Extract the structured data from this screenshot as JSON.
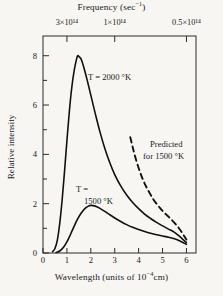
{
  "chart_data": {
    "type": "line",
    "title": "",
    "xlabel": "Wavelength (units of 10−4cm)",
    "ylabel": "Relative intensity",
    "top_axis_label": "Frequency  (sec−1)",
    "xlim": [
      0,
      6.4
    ],
    "ylim": [
      0,
      8.8
    ],
    "x_ticks": [
      0,
      1,
      2,
      3,
      4,
      5,
      6
    ],
    "x_tick_labels": [
      "0",
      "1",
      "2",
      "3",
      "4",
      "5",
      "6"
    ],
    "y_ticks": [
      0,
      2,
      4,
      6,
      8
    ],
    "y_tick_labels": [
      "0",
      "2",
      "4",
      "6",
      "8"
    ],
    "y_minor_ticks": [
      1,
      3,
      5,
      7
    ],
    "top_ticks_wavelength": [
      1,
      3,
      6
    ],
    "top_tick_labels": [
      "3×10¹⁴",
      "1×10¹⁴",
      "0.5×10¹⁴"
    ],
    "grid": false,
    "legend_position": "inline-annotations",
    "series": [
      {
        "name": "T = 2000 °K",
        "style": "solid",
        "peak_x": 1.45,
        "peak_y": 8.0,
        "points": [
          [
            0.4,
            0.05
          ],
          [
            0.5,
            0.18
          ],
          [
            0.6,
            0.52
          ],
          [
            0.7,
            1.2
          ],
          [
            0.8,
            2.15
          ],
          [
            0.9,
            3.3
          ],
          [
            1.0,
            4.55
          ],
          [
            1.1,
            5.72
          ],
          [
            1.2,
            6.68
          ],
          [
            1.3,
            7.38
          ],
          [
            1.4,
            7.85
          ],
          [
            1.45,
            8.0
          ],
          [
            1.5,
            7.97
          ],
          [
            1.6,
            7.85
          ],
          [
            1.7,
            7.55
          ],
          [
            1.85,
            7.0
          ],
          [
            2.0,
            6.4
          ],
          [
            2.2,
            5.6
          ],
          [
            2.4,
            4.85
          ],
          [
            2.6,
            4.2
          ],
          [
            2.8,
            3.65
          ],
          [
            3.0,
            3.18
          ],
          [
            3.25,
            2.72
          ],
          [
            3.5,
            2.35
          ],
          [
            3.75,
            2.05
          ],
          [
            4.0,
            1.8
          ],
          [
            4.25,
            1.58
          ],
          [
            4.5,
            1.4
          ],
          [
            4.75,
            1.24
          ],
          [
            5.0,
            1.1
          ],
          [
            5.25,
            0.97
          ],
          [
            5.5,
            0.84
          ],
          [
            5.75,
            0.64
          ],
          [
            6.0,
            0.42
          ]
        ]
      },
      {
        "name": "T = 1500 °K",
        "style": "solid",
        "peak_x": 2.0,
        "peak_y": 1.93,
        "points": [
          [
            0.55,
            0.02
          ],
          [
            0.7,
            0.08
          ],
          [
            0.85,
            0.22
          ],
          [
            1.0,
            0.45
          ],
          [
            1.15,
            0.75
          ],
          [
            1.3,
            1.08
          ],
          [
            1.45,
            1.38
          ],
          [
            1.6,
            1.62
          ],
          [
            1.75,
            1.8
          ],
          [
            1.9,
            1.9
          ],
          [
            2.0,
            1.93
          ],
          [
            2.1,
            1.92
          ],
          [
            2.25,
            1.88
          ],
          [
            2.4,
            1.8
          ],
          [
            2.6,
            1.68
          ],
          [
            2.8,
            1.55
          ],
          [
            3.0,
            1.42
          ],
          [
            3.25,
            1.28
          ],
          [
            3.5,
            1.15
          ],
          [
            3.75,
            1.04
          ],
          [
            4.0,
            0.95
          ],
          [
            4.25,
            0.87
          ],
          [
            4.5,
            0.8
          ],
          [
            4.75,
            0.74
          ],
          [
            5.0,
            0.69
          ],
          [
            5.25,
            0.64
          ],
          [
            5.5,
            0.58
          ],
          [
            5.75,
            0.48
          ],
          [
            6.0,
            0.35
          ]
        ]
      },
      {
        "name": "Predicted for 1500 °K",
        "style": "dashed",
        "points": [
          [
            3.65,
            4.7
          ],
          [
            3.75,
            4.3
          ],
          [
            3.85,
            3.92
          ],
          [
            4.0,
            3.45
          ],
          [
            4.15,
            3.05
          ],
          [
            4.3,
            2.72
          ],
          [
            4.45,
            2.45
          ],
          [
            4.6,
            2.2
          ],
          [
            4.75,
            2.0
          ],
          [
            4.9,
            1.82
          ],
          [
            5.05,
            1.66
          ],
          [
            5.2,
            1.52
          ],
          [
            5.35,
            1.38
          ],
          [
            5.5,
            1.22
          ],
          [
            5.65,
            1.05
          ],
          [
            5.8,
            0.85
          ],
          [
            5.95,
            0.62
          ],
          [
            6.0,
            0.55
          ]
        ]
      }
    ],
    "annotations": [
      {
        "id": "lab-2000",
        "text": "T = 2000  °K"
      },
      {
        "id": "lab-1500-a",
        "text": "T ="
      },
      {
        "id": "lab-1500-b",
        "text": "1500  °K"
      },
      {
        "id": "lab-pred-a",
        "text": "Predicted"
      },
      {
        "id": "lab-pred-b",
        "text": "for  1500  °K"
      }
    ]
  },
  "axes": {
    "top_title_main": "Frequency  (sec",
    "top_title_sup": "−1",
    "top_title_tail": ")",
    "bottom_title_main": "Wavelength  (units of  10",
    "bottom_title_sup": "−4",
    "bottom_title_tail": "cm)",
    "y_title": "Relative intensity"
  },
  "colors": {
    "background": "#f7f6f3",
    "ink": "#1a1a1a",
    "curve": "#111111",
    "frame": "#2b2b2b"
  }
}
